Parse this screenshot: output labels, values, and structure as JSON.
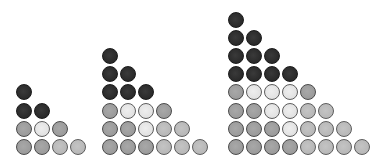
{
  "figure": {
    "colors": {
      "D": "#2a2a2a",
      "M": "#9e9e9e",
      "L": "#b8b8b8",
      "V": "#e4e4e4",
      "border": "#4a4a4a",
      "background": "#ffffff"
    },
    "layout": {
      "spacing_x": 18,
      "spacing_y": 18.2,
      "diameter": 16,
      "bottom_center_y": 147
    },
    "groups": [
      {
        "name": "group-n2",
        "left_center_x": 24,
        "rows": [
          [
            "D"
          ],
          [
            "D",
            "D"
          ],
          [
            "M",
            "V",
            "M"
          ],
          [
            "M",
            "M",
            "L",
            "L"
          ]
        ]
      },
      {
        "name": "group-n3",
        "left_center_x": 110,
        "rows": [
          [
            "D"
          ],
          [
            "D",
            "D"
          ],
          [
            "D",
            "D",
            "D"
          ],
          [
            "M",
            "V",
            "V",
            "M"
          ],
          [
            "M",
            "M",
            "V",
            "L",
            "L"
          ],
          [
            "M",
            "M",
            "M",
            "L",
            "L",
            "L"
          ]
        ]
      },
      {
        "name": "group-n4",
        "left_center_x": 236,
        "rows": [
          [
            "D"
          ],
          [
            "D",
            "D"
          ],
          [
            "D",
            "D",
            "D"
          ],
          [
            "D",
            "D",
            "D",
            "D"
          ],
          [
            "M",
            "V",
            "V",
            "V",
            "M"
          ],
          [
            "M",
            "M",
            "V",
            "V",
            "L",
            "L"
          ],
          [
            "M",
            "M",
            "M",
            "V",
            "L",
            "L",
            "L"
          ],
          [
            "M",
            "M",
            "M",
            "M",
            "L",
            "L",
            "L",
            "L"
          ]
        ]
      }
    ]
  }
}
